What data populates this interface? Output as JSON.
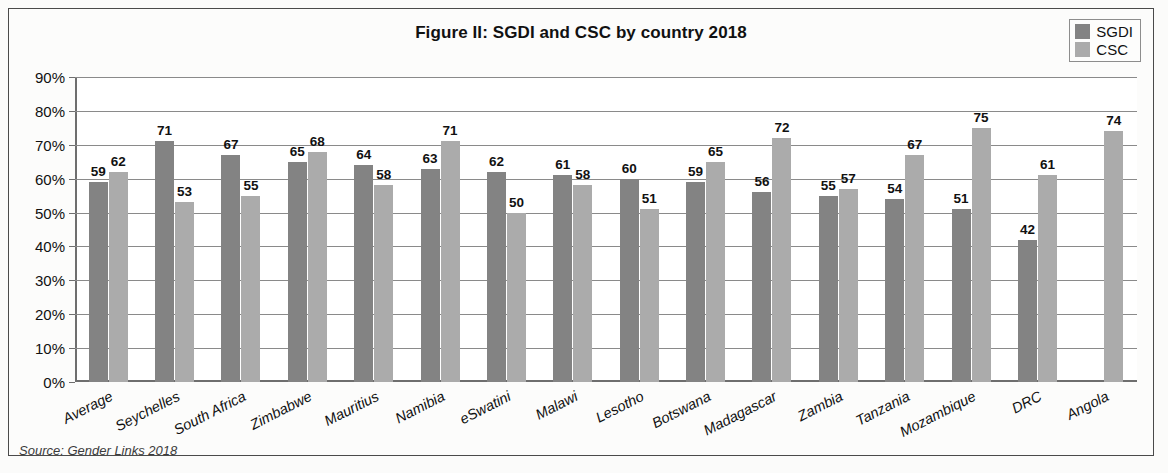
{
  "chart_data": {
    "type": "bar",
    "title": "Figure II: SGDI and CSC by country 2018",
    "xlabel": "",
    "ylabel": "",
    "ylim": [
      0,
      90
    ],
    "grid": true,
    "legend_position": "top-right",
    "ytick_labels": [
      "90%",
      "80%",
      "70%",
      "60%",
      "50%",
      "40%",
      "30%",
      "20%",
      "10%",
      "0%"
    ],
    "ytick_values": [
      90,
      80,
      70,
      60,
      50,
      40,
      30,
      20,
      10,
      0
    ],
    "categories": [
      "Average",
      "Seychelles",
      "South Africa",
      "Zimbabwe",
      "Mauritius",
      "Namibia",
      "eSwatini",
      "Malawi",
      "Lesotho",
      "Botswana",
      "Madagascar",
      "Zambia",
      "Tanzania",
      "Mozambique",
      "DRC",
      "Angola"
    ],
    "series": [
      {
        "name": "SGDI",
        "color": "#838383",
        "values": [
          59,
          71,
          67,
          65,
          64,
          63,
          62,
          61,
          60,
          59,
          56,
          55,
          54,
          51,
          42,
          null
        ]
      },
      {
        "name": "CSC",
        "color": "#ababab",
        "values": [
          62,
          53,
          55,
          68,
          58,
          71,
          50,
          58,
          51,
          65,
          72,
          57,
          67,
          75,
          61,
          74
        ]
      }
    ],
    "source_note": "Source: Gender Links 2018"
  },
  "legend": {
    "items": [
      {
        "label": "SGDI",
        "color": "#838383"
      },
      {
        "label": "CSC",
        "color": "#ababab"
      }
    ]
  }
}
